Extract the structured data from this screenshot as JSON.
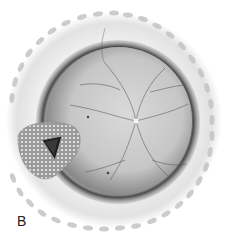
{
  "figure": {
    "panel_label": "B",
    "colors": {
      "background": "#ffffff",
      "outer_ring": "#e6e6e6",
      "scallop": "#c8c8c8",
      "dark_rim": "#3a3a3a",
      "fundus": "#cfcfcf",
      "vessels": "#555555",
      "optic_disc": "#f4f4f4",
      "aperture_plate": "#b5b5b5",
      "aperture_hole": "#1a1a1a"
    }
  }
}
